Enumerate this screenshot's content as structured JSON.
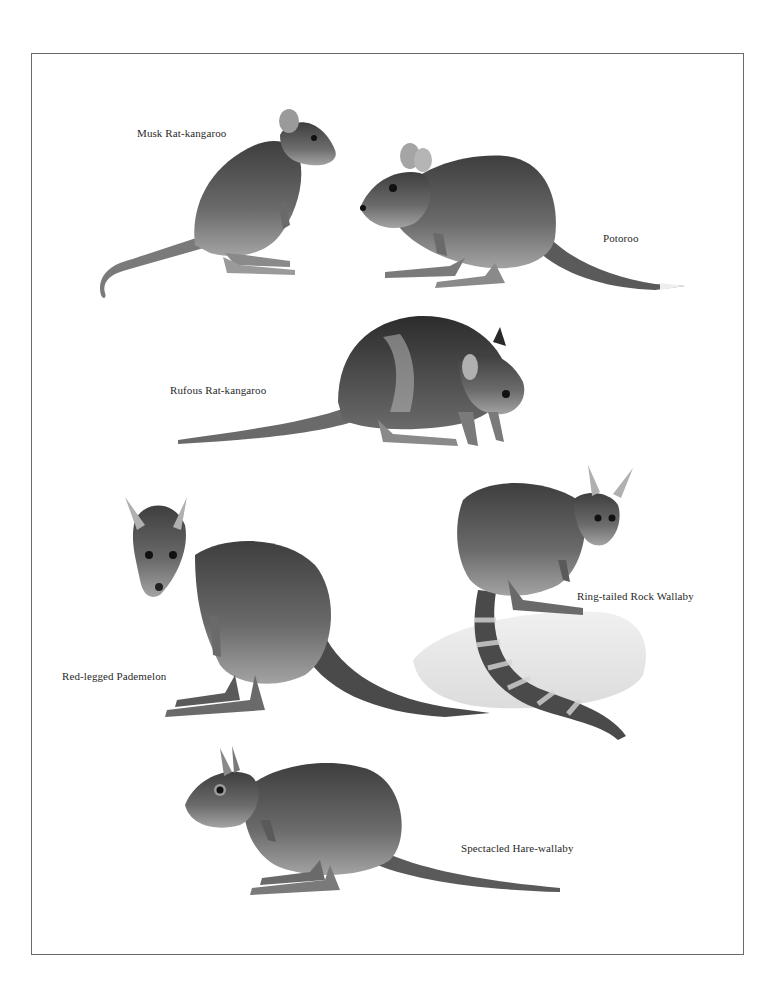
{
  "plate": {
    "frame_color": "#6a6a6a",
    "ink_color": "#2a2a2a"
  },
  "animals": [
    {
      "id": "musk-rat-kangaroo",
      "label": "Musk Rat-kangaroo"
    },
    {
      "id": "potoroo",
      "label": "Potoroo"
    },
    {
      "id": "rufous-rat-kangaroo",
      "label": "Rufous Rat-kangaroo"
    },
    {
      "id": "red-legged-pademelon",
      "label": "Red-legged Pademelon"
    },
    {
      "id": "ring-tailed-rock-wallaby",
      "label": "Ring-tailed Rock Wallaby"
    },
    {
      "id": "spectacled-hare-wallaby",
      "label": "Spectacled Hare-wallaby"
    }
  ]
}
